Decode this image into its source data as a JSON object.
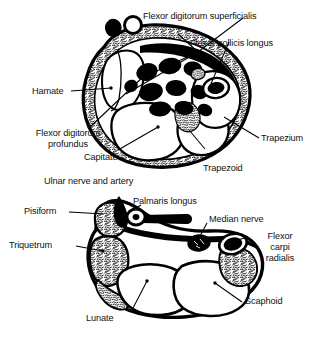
{
  "figure": {
    "colors": {
      "background": "#ffffff",
      "ink": "#000000",
      "tendon_fill": "#000000",
      "bone_fill": "#ffffff",
      "cortex_stipple": "#000000"
    },
    "panels": [
      {
        "name": "distal-carpal-row-section",
        "position": "upper"
      },
      {
        "name": "proximal-carpal-row-section",
        "position": "lower"
      }
    ]
  },
  "upper_section": {
    "labels": {
      "flexor_digitorum_superficialis": "Flexor digitorum superficialis",
      "flexor_pollicis_longus": "Flexor pollicis longus",
      "hamate": "Hamate",
      "flexor_digitorum_profundus_line1": "Flexor digitorum",
      "flexor_digitorum_profundus_line2": "profundus",
      "capitate": "Capitate",
      "trapezium": "Trapezium",
      "trapezoid": "Trapezoid",
      "ulnar_nerve_and_artery": "Ulnar nerve and artery"
    }
  },
  "lower_section": {
    "labels": {
      "palmaris_longus": "Palmaris longus",
      "median_nerve": "Median nerve",
      "pisiform": "Pisiform",
      "triquetrum": "Triquetrum",
      "flexor_carpi_radialis_line1": "Flexor",
      "flexor_carpi_radialis_line2": "carpi",
      "flexor_carpi_radialis_line3": "radialis",
      "lunate": "Lunate",
      "scaphoid": "Scaphoid"
    }
  }
}
